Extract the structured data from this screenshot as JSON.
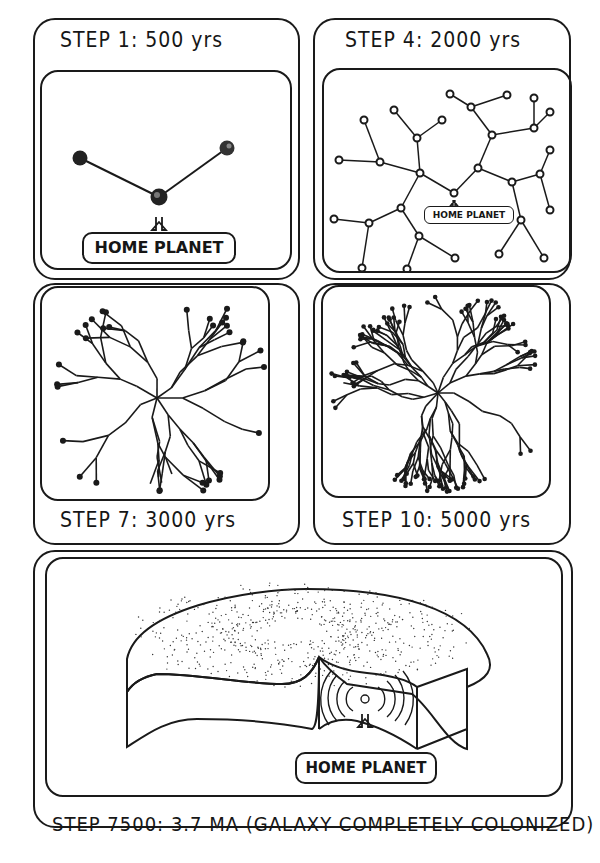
{
  "panels": [
    {
      "id": "step1",
      "caption": "STEP 1: 500 yrs",
      "label": "HOME PLANET"
    },
    {
      "id": "step4",
      "caption": "STEP 4: 2000 yrs",
      "label": "HOME PLANET"
    },
    {
      "id": "step7",
      "caption": "STEP 7: 3000 yrs"
    },
    {
      "id": "step10",
      "caption": "STEP 10: 5000 yrs"
    },
    {
      "id": "step7500",
      "caption": "STEP 7500: 3.7 MA (GALAXY COMPLETELY COLONIZED)",
      "label": "HOME PLANET"
    }
  ],
  "colors": {
    "ink": "#1a1a1a",
    "paper": "#ffffff"
  }
}
